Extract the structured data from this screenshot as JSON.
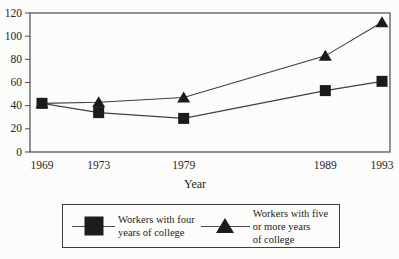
{
  "chart_data": {
    "type": "line",
    "x": [
      1969,
      1973,
      1979,
      1989,
      1993
    ],
    "xlabel": "Year",
    "ylabel": "",
    "ylim": [
      0,
      120
    ],
    "yticks": [
      0,
      20,
      40,
      60,
      80,
      100,
      120
    ],
    "grid": false,
    "series": [
      {
        "name": "Workers with four years of college",
        "marker": "square",
        "values": [
          42,
          34,
          29,
          53,
          61
        ]
      },
      {
        "name": "Workers with five or more years of college",
        "marker": "triangle",
        "values": [
          42,
          43,
          47,
          83,
          112
        ]
      }
    ],
    "legend": {
      "position": "bottom",
      "items": [
        {
          "marker": "square",
          "label": "Workers with four\nyears of college"
        },
        {
          "marker": "triangle",
          "label": "Workers with five\nor more years\nof college"
        }
      ]
    }
  },
  "colors": {
    "background": "#fcfcfb",
    "axis": "#4a4a4a",
    "line": "#3f3f3f",
    "marker": "#1b1b1b",
    "text": "#262626"
  }
}
